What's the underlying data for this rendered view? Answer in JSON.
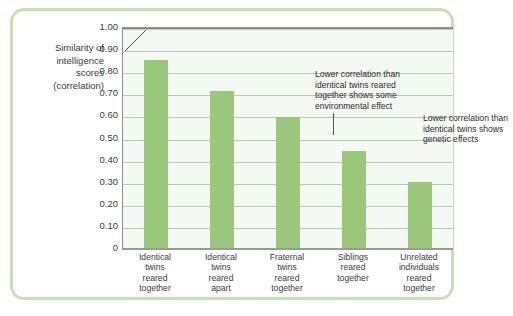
{
  "chart_data": {
    "type": "bar",
    "title": "",
    "xlabel": "",
    "ylabel": "Similarity of intelligence scores (correlation)",
    "ylim": [
      0,
      1.0
    ],
    "grid": true,
    "legend": "none",
    "categories": [
      "Identical\ntwins\nreared\ntogether",
      "Identical\ntwins\nreared\napart",
      "Fraternal\ntwins\nreared\ntogether",
      "Siblings\nreared\ntogether",
      "Unrelated\nindividuals\nreared\ntogether"
    ],
    "values": [
      0.86,
      0.72,
      0.6,
      0.45,
      0.31
    ],
    "ytick_labels": [
      "1.00",
      "0.90",
      "0.80",
      "0.70",
      "0.60",
      "0.50",
      "0.40",
      "0.30",
      "0.20",
      "0.10",
      "0"
    ],
    "ytick_values": [
      1.0,
      0.9,
      0.8,
      0.7,
      0.6,
      0.5,
      0.4,
      0.3,
      0.2,
      0.1,
      0
    ],
    "annotations": [
      {
        "text": "Lower correlation than\nidentical twins reared\ntogether shows some\nenvironmental effect",
        "points_to_category": "Identical twins reared apart"
      },
      {
        "text": "Lower correlation than\nidentical twins shows\ngenetic effects",
        "points_to_category": "Fraternal twins reared together"
      }
    ],
    "colors": {
      "bar": "#9ac77a",
      "frame": "#c6e0b4",
      "plot_background": "#f4f9f3",
      "gridline": "#b9c7b5",
      "axis": "#8e8e8e",
      "text": "#3a3a3a"
    }
  },
  "y_axis_title_text": "Similarity of\nintelligence\nscores\n(correlation)"
}
